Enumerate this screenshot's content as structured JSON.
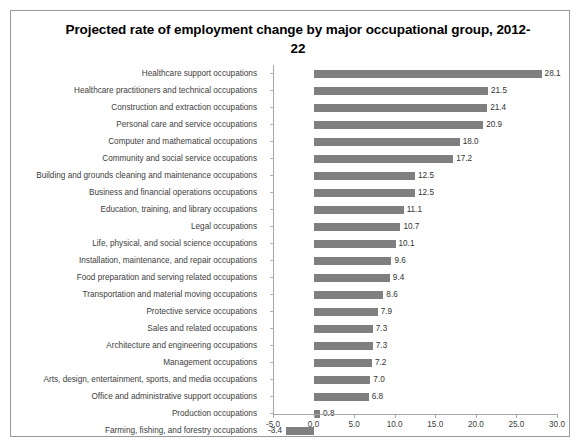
{
  "chart_data": {
    "type": "bar",
    "orientation": "horizontal",
    "title": "Projected rate of employment change by major occupational group, 2012-22",
    "xlabel": "",
    "ylabel": "",
    "xlim": [
      -5.0,
      30.0
    ],
    "xticks": [
      "-5.0",
      "0.0",
      "5.0",
      "10.0",
      "15.0",
      "20.0",
      "25.0",
      "30.0"
    ],
    "xtick_values": [
      -5.0,
      0.0,
      5.0,
      10.0,
      15.0,
      20.0,
      25.0,
      30.0
    ],
    "grid": false,
    "legend": null,
    "bar_color": "#7f7f7f",
    "data_labels": true,
    "categories": [
      "Healthcare support occupations",
      "Healthcare practitioners and technical occupations",
      "Construction and extraction occupations",
      "Personal care and service occupations",
      "Computer and mathematical occupations",
      "Community and social service occupations",
      "Building and grounds cleaning and maintenance occupations",
      "Business and financial operations occupations",
      "Education, training, and library occupations",
      "Legal occupations",
      "Life, physical, and social science occupations",
      "Installation, maintenance, and repair occupations",
      "Food preparation and serving related occupations",
      "Transportation and material moving occupations",
      "Protective service occupations",
      "Sales and related occupations",
      "Architecture and engineering occupations",
      "Management occupations",
      "Arts, design, entertainment, sports, and media occupations",
      "Office and administrative support occupations",
      "Production occupations",
      "Farming, fishing, and forestry occupations"
    ],
    "values": [
      28.1,
      21.5,
      21.4,
      20.9,
      18.0,
      17.2,
      12.5,
      12.5,
      11.1,
      10.7,
      10.1,
      9.6,
      9.4,
      8.6,
      7.9,
      7.3,
      7.3,
      7.2,
      7.0,
      6.8,
      0.8,
      -3.4
    ],
    "value_labels": [
      "28.1",
      "21.5",
      "21.4",
      "20.9",
      "18.0",
      "17.2",
      "12.5",
      "12.5",
      "11.1",
      "10.7",
      "10.1",
      "9.6",
      "9.4",
      "8.6",
      "7.9",
      "7.3",
      "7.3",
      "7.2",
      "7.0",
      "6.8",
      "0.8",
      "-3.4"
    ]
  }
}
